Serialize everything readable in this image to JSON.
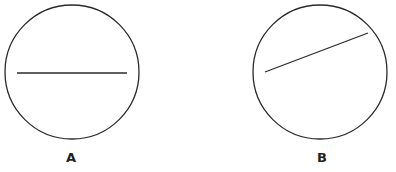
{
  "figures": [
    {
      "label": "A",
      "circle": {
        "cx": 72,
        "cy": 72,
        "r": 67
      },
      "line": {
        "x1": 17,
        "y1": 73,
        "x2": 127,
        "y2": 73
      },
      "label_pos": {
        "x": 66,
        "y": 162
      }
    },
    {
      "label": "B",
      "circle": {
        "cx": 320,
        "cy": 72,
        "r": 67
      },
      "line": {
        "x1": 265,
        "y1": 72,
        "x2": 368,
        "y2": 33
      },
      "label_pos": {
        "x": 317,
        "y": 162
      }
    }
  ],
  "colors": {
    "stroke": "#2a2a2a",
    "background": "#ffffff"
  }
}
